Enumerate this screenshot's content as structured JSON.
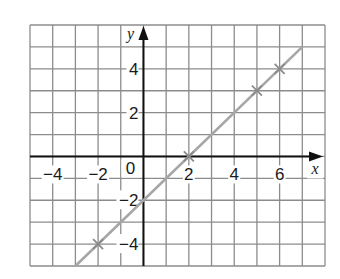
{
  "chart_data": {
    "type": "line",
    "title": "",
    "xlabel": "x",
    "ylabel": "y",
    "xlim": [
      -5,
      8
    ],
    "ylim": [
      -5,
      6
    ],
    "grid": true,
    "x_ticks": [
      -4,
      -2,
      2,
      4,
      6
    ],
    "y_ticks": [
      4,
      2,
      -2,
      -4
    ],
    "origin_label": "0",
    "series": [
      {
        "name": "y = x - 2",
        "x": [
          -3,
          7
        ],
        "y": [
          -5,
          5
        ],
        "color": "#a6a6a6"
      }
    ],
    "marked_points": [
      {
        "x": -2,
        "y": -4
      },
      {
        "x": 2,
        "y": 0
      },
      {
        "x": 5,
        "y": 3
      },
      {
        "x": 6,
        "y": 4
      }
    ]
  },
  "colors": {
    "grid": "#8c8c8c",
    "axis": "#111111",
    "line": "#a6a6a6"
  }
}
